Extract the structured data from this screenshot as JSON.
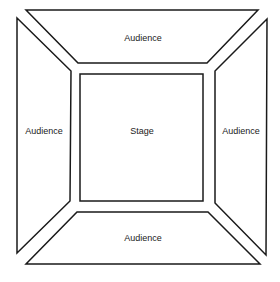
{
  "diagram": {
    "type": "theatre-in-the-round floor plan",
    "stroke_color": "#1a1a1a",
    "background_color": "#ffffff",
    "regions": {
      "top": {
        "label": "Audience",
        "shape": "trapezoid"
      },
      "left": {
        "label": "Audience",
        "shape": "trapezoid"
      },
      "right": {
        "label": "Audience",
        "shape": "trapezoid"
      },
      "bottom": {
        "label": "Audience",
        "shape": "trapezoid"
      },
      "center": {
        "label": "Stage",
        "shape": "square"
      }
    }
  }
}
